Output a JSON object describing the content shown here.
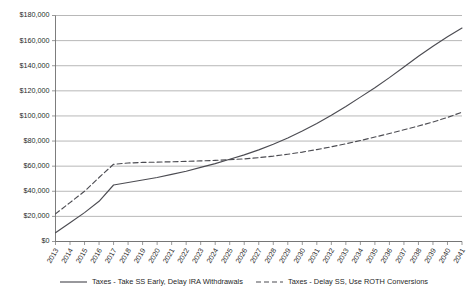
{
  "chart_data": {
    "type": "line",
    "title": "",
    "xlabel": "",
    "ylabel": "",
    "grid": true,
    "legend_position": "bottom",
    "ylim": [
      0,
      180000
    ],
    "ytick_step": 20000,
    "ytick_labels": [
      "$0",
      "$20,000",
      "$40,000",
      "$60,000",
      "$80,000",
      "$100,000",
      "$120,000",
      "$140,000",
      "$160,000",
      "$180,000"
    ],
    "ytick_values": [
      0,
      20000,
      40000,
      60000,
      80000,
      100000,
      120000,
      140000,
      160000,
      180000
    ],
    "categories": [
      "2013",
      "2014",
      "2015",
      "2016",
      "2017",
      "2018",
      "2019",
      "2020",
      "2021",
      "2022",
      "2023",
      "2024",
      "2025",
      "2026",
      "2027",
      "2028",
      "2029",
      "2030",
      "2031",
      "2032",
      "2033",
      "2034",
      "2035",
      "2036",
      "2037",
      "2038",
      "2039",
      "2040",
      "2041"
    ],
    "series": [
      {
        "name": "Taxes - Take SS Early, Delay IRA Withdrawals",
        "style": "solid",
        "color": "#4c4c52",
        "values": [
          7000,
          15000,
          23000,
          32000,
          45000,
          47000,
          49000,
          51000,
          53500,
          56000,
          59000,
          62000,
          65500,
          69000,
          73000,
          77500,
          82500,
          88000,
          94000,
          100500,
          107500,
          115000,
          122500,
          130500,
          139000,
          147500,
          155500,
          163000,
          170000
        ]
      },
      {
        "name": "Taxes - Delay SS, Use ROTH Conversions",
        "style": "dashed",
        "color": "#4c4c52",
        "values": [
          22000,
          31000,
          40000,
          51000,
          61500,
          62500,
          63000,
          63200,
          63500,
          63800,
          64200,
          64600,
          65200,
          65800,
          66800,
          68000,
          69500,
          71200,
          73200,
          75400,
          77800,
          80400,
          83200,
          86000,
          89000,
          92000,
          95200,
          98800,
          103000
        ]
      }
    ]
  },
  "legend": {
    "items": [
      {
        "label": "Taxes - Take SS Early, Delay IRA Withdrawals",
        "style": "solid"
      },
      {
        "label": "Taxes - Delay SS, Use ROTH Conversions",
        "style": "dashed"
      }
    ]
  }
}
